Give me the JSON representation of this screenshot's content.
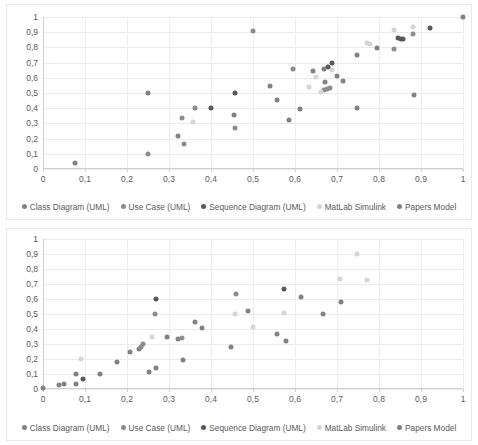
{
  "series_colors": {
    "class_diagram": "#808285",
    "use_case": "#8a8c8e",
    "sequence_diagram": "#58595b",
    "matlab_simulink": "#d4d5d6",
    "papers_model": "#7f8184"
  },
  "legend": {
    "items": [
      {
        "label": "Class Diagram (UML)",
        "key": "class_diagram",
        "color": "#808285"
      },
      {
        "label": "Use Case (UML)",
        "key": "use_case",
        "color": "#8a8c8e"
      },
      {
        "label": "Sequence Diagram (UML)",
        "key": "sequence_diagram",
        "color": "#58595b"
      },
      {
        "label": "MatLab Simulink",
        "key": "matlab_simulink",
        "color": "#d4d5d6"
      },
      {
        "label": "Papers Model",
        "key": "papers_model",
        "color": "#7f8184"
      }
    ]
  },
  "axis": {
    "y_ticks": [
      "1",
      "0,9",
      "0,8",
      "0,7",
      "0,6",
      "0,5",
      "0,4",
      "0,3",
      "0,2",
      "0,1",
      "0"
    ],
    "x_ticks": [
      "0",
      "0,1",
      "0,2",
      "0,3",
      "0,4",
      "0,5",
      "0,6",
      "0,7",
      "0,8",
      "0,9",
      "1"
    ]
  },
  "chart_data": [
    {
      "id": "chart-top",
      "type": "scatter",
      "title": "",
      "xlabel": "",
      "ylabel": "",
      "xlim": [
        0,
        1
      ],
      "ylim": [
        0,
        1
      ],
      "xticks": [
        0,
        0.1,
        0.2,
        0.3,
        0.4,
        0.5,
        0.6,
        0.7,
        0.8,
        0.9,
        1
      ],
      "yticks": [
        0,
        0.1,
        0.2,
        0.3,
        0.4,
        0.5,
        0.6,
        0.7,
        0.8,
        0.9,
        1
      ],
      "grid": true,
      "legend_position": "bottom",
      "series": [
        {
          "name": "Class Diagram (UML)",
          "color": "#808285",
          "points": [
            [
              0.077,
              0.038
            ],
            [
              0.25,
              0.5
            ],
            [
              0.322,
              0.215
            ],
            [
              0.455,
              0.357
            ],
            [
              0.541,
              0.544
            ],
            [
              0.556,
              0.452
            ],
            [
              0.585,
              0.321
            ],
            [
              0.611,
              0.393
            ],
            [
              0.643,
              0.645
            ],
            [
              0.671,
              0.575
            ],
            [
              0.714,
              0.58
            ],
            [
              0.748,
              0.748
            ],
            [
              0.795,
              0.798
            ],
            [
              0.748,
              0.401
            ],
            [
              0.883,
              0.489
            ],
            [
              1.0,
              1.0
            ]
          ]
        },
        {
          "name": "Use Case (UML)",
          "color": "#8a8c8e",
          "points": [
            [
              0.25,
              0.099
            ],
            [
              0.332,
              0.334
            ],
            [
              0.336,
              0.165
            ],
            [
              0.362,
              0.399
            ],
            [
              0.456,
              0.27
            ],
            [
              0.5,
              0.908
            ],
            [
              0.596,
              0.657
            ],
            [
              0.668,
              0.52
            ],
            [
              0.676,
              0.528
            ],
            [
              0.684,
              0.535
            ],
            [
              0.836,
              0.79
            ],
            [
              0.881,
              0.888
            ]
          ]
        },
        {
          "name": "Sequence Diagram (UML)",
          "color": "#58595b",
          "points": [
            [
              0.399,
              0.399
            ],
            [
              0.456,
              0.501
            ],
            [
              0.679,
              0.67
            ],
            [
              0.688,
              0.697
            ],
            [
              0.845,
              0.862
            ],
            [
              0.852,
              0.857
            ],
            [
              0.858,
              0.853
            ],
            [
              0.922,
              0.925
            ]
          ]
        },
        {
          "name": "MatLab Simulink",
          "color": "#d4d5d6",
          "points": [
            [
              0.356,
              0.31
            ],
            [
              0.634,
              0.537
            ],
            [
              0.65,
              0.608
            ],
            [
              0.663,
              0.505
            ],
            [
              0.689,
              0.65
            ],
            [
              0.772,
              0.832
            ],
            [
              0.779,
              0.821
            ],
            [
              0.836,
              0.914
            ],
            [
              0.881,
              0.937
            ]
          ]
        },
        {
          "name": "Papers Model",
          "color": "#7f8184",
          "points": [
            [
              0.669,
              0.66
            ],
            [
              0.699,
              0.615
            ]
          ]
        }
      ]
    },
    {
      "id": "chart-bottom",
      "type": "scatter",
      "title": "",
      "xlabel": "",
      "ylabel": "",
      "xlim": [
        0,
        1
      ],
      "ylim": [
        0,
        1
      ],
      "xticks": [
        0,
        0.1,
        0.2,
        0.3,
        0.4,
        0.5,
        0.6,
        0.7,
        0.8,
        0.9,
        1
      ],
      "yticks": [
        0,
        0.1,
        0.2,
        0.3,
        0.4,
        0.5,
        0.6,
        0.7,
        0.8,
        0.9,
        1
      ],
      "grid": true,
      "legend_position": "bottom",
      "series": [
        {
          "name": "Class Diagram (UML)",
          "color": "#808285",
          "points": [
            [
              0.0,
              0.004
            ],
            [
              0.037,
              0.028
            ],
            [
              0.051,
              0.034
            ],
            [
              0.079,
              0.036
            ],
            [
              0.079,
              0.101
            ],
            [
              0.136,
              0.097
            ],
            [
              0.175,
              0.178
            ],
            [
              0.207,
              0.248
            ],
            [
              0.228,
              0.27
            ],
            [
              0.252,
              0.115
            ],
            [
              0.268,
              0.137
            ],
            [
              0.295,
              0.347
            ],
            [
              0.321,
              0.331
            ],
            [
              0.334,
              0.196
            ],
            [
              0.363,
              0.444
            ],
            [
              0.379,
              0.406
            ],
            [
              0.447,
              0.277
            ],
            [
              0.489,
              0.519
            ],
            [
              0.556,
              0.365
            ],
            [
              0.578,
              0.321
            ],
            [
              0.614,
              0.616
            ],
            [
              0.666,
              0.503
            ],
            [
              0.71,
              0.579
            ]
          ]
        },
        {
          "name": "Use Case (UML)",
          "color": "#8a8c8e",
          "points": [
            [
              0.233,
              0.277
            ],
            [
              0.239,
              0.299
            ],
            [
              0.266,
              0.501
            ],
            [
              0.33,
              0.337
            ],
            [
              0.459,
              0.636
            ]
          ]
        },
        {
          "name": "Sequence Diagram (UML)",
          "color": "#58595b",
          "points": [
            [
              0.096,
              0.066
            ],
            [
              0.269,
              0.603
            ],
            [
              0.573,
              0.668
            ]
          ]
        },
        {
          "name": "MatLab Simulink",
          "color": "#d4d5d6",
          "points": [
            [
              0.09,
              0.198
            ],
            [
              0.26,
              0.345
            ],
            [
              0.458,
              0.501
            ],
            [
              0.5,
              0.414
            ],
            [
              0.574,
              0.51
            ],
            [
              0.706,
              0.735
            ],
            [
              0.748,
              0.9
            ],
            [
              0.772,
              0.728
            ]
          ]
        },
        {
          "name": "Papers Model",
          "color": "#7f8184",
          "points": []
        }
      ]
    }
  ]
}
